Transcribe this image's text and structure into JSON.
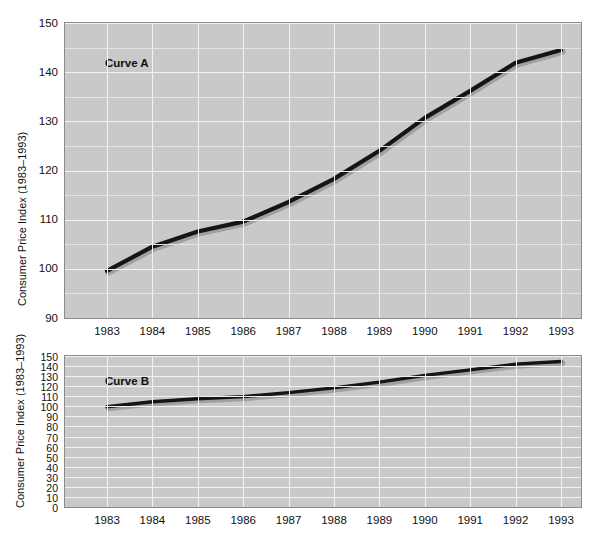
{
  "figure": {
    "axis_title": "Consumer Price Index (1983–1993)",
    "background_color": "#ffffff",
    "plot_background_color": "#c9c9c9",
    "grid_color": "#f2f2f2",
    "curve_color": "#151515"
  },
  "panels": [
    {
      "id": "curve-a",
      "series_label": "Curve A",
      "ylabel": "Consumer Price Index (1983–1993)",
      "yticks": [
        "150",
        "140",
        "130",
        "120",
        "110",
        "100",
        "90"
      ],
      "xticks": [
        "1983",
        "1984",
        "1985",
        "1986",
        "1987",
        "1988",
        "1989",
        "1990",
        "1991",
        "1992",
        "1993"
      ]
    },
    {
      "id": "curve-b",
      "series_label": "Curve B",
      "ylabel": "Consumer Price Index (1983–1993)",
      "yticks": [
        "150",
        "140",
        "130",
        "120",
        "110",
        "100",
        "90",
        "80",
        "70",
        "60",
        "50",
        "40",
        "30",
        "20",
        "10",
        "0"
      ],
      "xticks": [
        "1983",
        "1984",
        "1985",
        "1986",
        "1987",
        "1988",
        "1989",
        "1990",
        "1991",
        "1992",
        "1993"
      ]
    }
  ],
  "chart_data": [
    {
      "type": "line",
      "id": "curve-a",
      "title": "Curve A",
      "xlabel": "",
      "ylabel": "Consumer Price Index (1983–1993)",
      "categories": [
        "1983",
        "1984",
        "1985",
        "1986",
        "1987",
        "1988",
        "1989",
        "1990",
        "1991",
        "1992",
        "1993"
      ],
      "x": [
        1983,
        1984,
        1985,
        1986,
        1987,
        1988,
        1989,
        1990,
        1991,
        1992,
        1993
      ],
      "series": [
        {
          "name": "Consumer Price Index",
          "values": [
            99.6,
            104.5,
            107.6,
            109.6,
            113.6,
            118.3,
            124.0,
            130.7,
            136.2,
            141.9,
            144.5
          ]
        }
      ],
      "ylim": [
        90,
        150
      ],
      "xlim": [
        1983,
        1993
      ],
      "yticks": [
        90,
        100,
        110,
        120,
        130,
        140,
        150
      ],
      "grid": true,
      "legend": "none",
      "annotations": [
        "Curve A"
      ]
    },
    {
      "type": "line",
      "id": "curve-b",
      "title": "Curve B",
      "xlabel": "",
      "ylabel": "Consumer Price Index (1983–1993)",
      "categories": [
        "1983",
        "1984",
        "1985",
        "1986",
        "1987",
        "1988",
        "1989",
        "1990",
        "1991",
        "1992",
        "1993"
      ],
      "x": [
        1983,
        1984,
        1985,
        1986,
        1987,
        1988,
        1989,
        1990,
        1991,
        1992,
        1993
      ],
      "series": [
        {
          "name": "Consumer Price Index",
          "values": [
            99.6,
            104.5,
            107.6,
            109.6,
            113.6,
            118.3,
            124.0,
            130.7,
            136.2,
            141.9,
            144.5
          ]
        }
      ],
      "ylim": [
        0,
        150
      ],
      "xlim": [
        1983,
        1993
      ],
      "yticks": [
        0,
        10,
        20,
        30,
        40,
        50,
        60,
        70,
        80,
        90,
        100,
        110,
        120,
        130,
        140,
        150
      ],
      "grid": true,
      "legend": "none",
      "annotations": [
        "Curve B"
      ]
    }
  ]
}
